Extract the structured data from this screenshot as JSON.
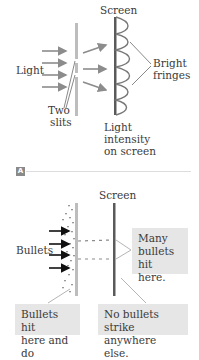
{
  "panel_a": {
    "label_screen": "Screen",
    "label_light": "Light",
    "label_two": "Two",
    "label_slits": "slits",
    "label_bright": "Bright",
    "label_fringes": "fringes",
    "label_intensity_1": "Light",
    "label_intensity_2": "intensity",
    "label_intensity_3": "on screen",
    "badge": "A"
  },
  "panel_b": {
    "label_screen": "Screen",
    "label_bullets": "Bullets",
    "box_many_1": "Many",
    "box_many_2": "bullets",
    "box_many_3": "hit here.",
    "box_left_1": "Bullets hit",
    "box_left_2": "here and do",
    "box_right_1": "No bullets strike",
    "box_right_2": "anywhere else."
  },
  "colors": {
    "arrow_gray": "#8c8c8c",
    "wall_gray": "#bdbdbd",
    "screen_dark": "#5a5a5a",
    "box_bg": "#e6e6e6",
    "black_arrow": "#111111"
  }
}
